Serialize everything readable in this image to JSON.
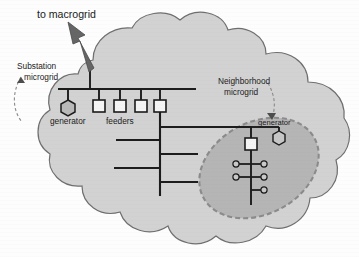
{
  "diagram": {
    "labels": {
      "macrogrid": "to macrogrid",
      "substation_microgrid_line1": "Substation",
      "substation_microgrid_line2": "microgrid",
      "neighborhood_microgrid_line1": "Neighborhood",
      "neighborhood_microgrid_line2": "microgrid",
      "substation_generator": "generator",
      "feeders": "feeders",
      "neighborhood_generator": "generator"
    },
    "colors": {
      "cloud_fill": "#d2d2d2",
      "cloud_stroke": "#6e6e6e",
      "ellipse_fill": "#b4b4b4",
      "ellipse_stroke": "#8a8a8a",
      "line": "#1c1c1c",
      "node_fill": "#f2f2f2",
      "generator_fill": "#b9b9b9",
      "arrow_fill": "#6a6a6a",
      "text": "#1b1b1b",
      "page_background": "#fdfdfd"
    },
    "elements": {
      "cloud": {
        "name": "substation-microgrid-cloud",
        "lobes": 11
      },
      "macrogrid_arrow": {
        "name": "macrogrid-arrow",
        "direction": "up-left"
      },
      "substation_bus": {
        "name": "substation-busbar"
      },
      "feeder_breakers": {
        "count": 4,
        "shape": "square"
      },
      "substation_generator": {
        "shape": "hexagon"
      },
      "distribution_trunk": {
        "name": "distribution-trunk-line"
      },
      "lateral_branches": {
        "count": 4
      },
      "neighborhood_ellipse": {
        "name": "neighborhood-microgrid-boundary",
        "border": "dashed"
      },
      "neighborhood_breaker": {
        "shape": "square",
        "count": 1
      },
      "neighborhood_generator": {
        "shape": "hexagon"
      },
      "neighborhood_loads": {
        "count": 5,
        "shape": "circle"
      },
      "substation_pointer": {
        "name": "substation-microgrid-pointer",
        "style": "dashed-curve-arrow"
      },
      "neighborhood_pointer": {
        "name": "neighborhood-microgrid-pointer",
        "style": "dashed-curve-arrow"
      }
    }
  }
}
